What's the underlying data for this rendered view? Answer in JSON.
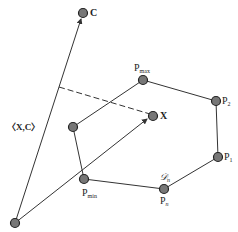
{
  "diagram": {
    "points": {
      "origin": {
        "x": 15,
        "y": 223
      },
      "C": {
        "x": 83,
        "y": 13,
        "label": "C"
      },
      "X": {
        "x": 153,
        "y": 116,
        "label": "X"
      },
      "Pmax": {
        "x": 143,
        "y": 80,
        "label": "P",
        "sub": "max"
      },
      "P2": {
        "x": 216,
        "y": 101,
        "label": "P",
        "sub": "2"
      },
      "P1": {
        "x": 218,
        "y": 157,
        "label": "P",
        "sub": "1"
      },
      "Pn": {
        "x": 164,
        "y": 189,
        "label": "P",
        "sub": "n"
      },
      "Pmin": {
        "x": 84,
        "y": 179,
        "label": "P",
        "sub": "min"
      },
      "Pleft": {
        "x": 73,
        "y": 127
      }
    },
    "inner_product_label": "〈X,C〉",
    "polygon_label": "𝒟",
    "polygon_label_sub": "n",
    "colors": {
      "point_fill": "#777777",
      "stroke": "#333333"
    }
  }
}
